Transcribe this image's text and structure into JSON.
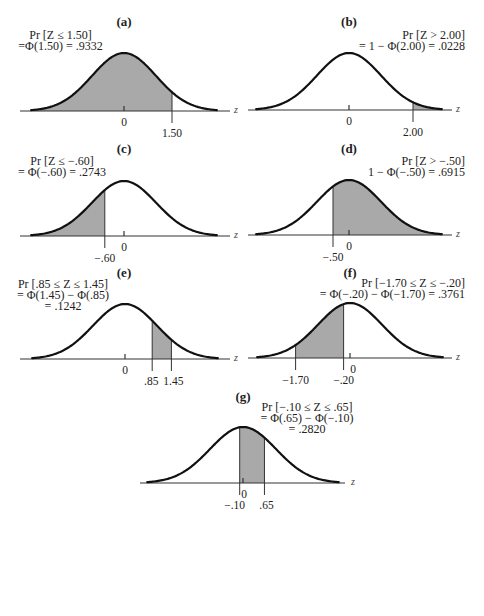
{
  "chart_data": [
    {
      "id": "a",
      "type": "area",
      "panel_label": "(a)",
      "title_lines": [
        "Pr [Z ≤ 1.50]",
        "=Φ(1.50) = .9332"
      ],
      "distribution": "standard normal",
      "shade": {
        "from": null,
        "to": 1.5
      },
      "probability": 0.9332,
      "xlabel": "z",
      "tick_labels": [
        {
          "value": 0,
          "text": "0"
        },
        {
          "value": 1.5,
          "text": "1.50"
        }
      ],
      "xlim": [
        -2.9,
        2.9
      ]
    },
    {
      "id": "b",
      "type": "area",
      "panel_label": "(b)",
      "title_lines": [
        "Pr [Z > 2.00]",
        "= 1 − Φ(2.00) = .0228"
      ],
      "distribution": "standard normal",
      "shade": {
        "from": 2.0,
        "to": null
      },
      "probability": 0.0228,
      "xlabel": "z",
      "tick_labels": [
        {
          "value": 0,
          "text": "0"
        },
        {
          "value": 2.0,
          "text": "2.00"
        }
      ],
      "xlim": [
        -2.9,
        2.9
      ]
    },
    {
      "id": "c",
      "type": "area",
      "panel_label": "(c)",
      "title_lines": [
        "Pr [Z ≤ −.60]",
        "= Φ(−.60) = .2743"
      ],
      "distribution": "standard normal",
      "shade": {
        "from": null,
        "to": -0.6
      },
      "probability": 0.2743,
      "xlabel": "z",
      "tick_labels": [
        {
          "value": 0,
          "text": "0"
        },
        {
          "value": -0.6,
          "text": "−.60"
        }
      ],
      "xlim": [
        -2.9,
        2.9
      ]
    },
    {
      "id": "d",
      "type": "area",
      "panel_label": "(d)",
      "title_lines": [
        "Pr [Z > −.50]",
        "1 − Φ(−.50) = .6915"
      ],
      "distribution": "standard normal",
      "shade": {
        "from": -0.5,
        "to": null
      },
      "probability": 0.6915,
      "xlabel": "z",
      "tick_labels": [
        {
          "value": 0,
          "text": "0"
        },
        {
          "value": -0.5,
          "text": "−.50"
        }
      ],
      "xlim": [
        -2.9,
        2.9
      ]
    },
    {
      "id": "e",
      "type": "area",
      "panel_label": "(e)",
      "title_lines": [
        "Pr [.85 ≤ Z ≤ 1.45]",
        "= Φ(1.45) − Φ(.85)",
        "= .1242"
      ],
      "distribution": "standard normal",
      "shade": {
        "from": 0.85,
        "to": 1.45
      },
      "probability": 0.1242,
      "xlabel": "z",
      "tick_labels": [
        {
          "value": 0,
          "text": "0"
        },
        {
          "value": 0.85,
          "text": ".85"
        },
        {
          "value": 1.45,
          "text": "1.45"
        }
      ],
      "xlim": [
        -2.9,
        2.9
      ]
    },
    {
      "id": "f",
      "type": "area",
      "panel_label": "(f)",
      "title_lines": [
        "Pr [−1.70 ≤ Z ≤ −.20]",
        "= Φ(−.20) − Φ(−1.70) = .3761"
      ],
      "distribution": "standard normal",
      "shade": {
        "from": -1.7,
        "to": -0.2
      },
      "probability": 0.3761,
      "xlabel": "z",
      "tick_labels": [
        {
          "value": 0,
          "text": "0"
        },
        {
          "value": -1.7,
          "text": "−1.70"
        },
        {
          "value": -0.2,
          "text": "−.20"
        }
      ],
      "xlim": [
        -2.9,
        2.9
      ]
    },
    {
      "id": "g",
      "type": "area",
      "panel_label": "(g)",
      "title_lines": [
        "Pr [−.10 ≤ Z ≤ .65]",
        "= Φ(.65) − Φ(−.10)",
        "= .2820"
      ],
      "distribution": "standard normal",
      "shade": {
        "from": -0.1,
        "to": 0.65
      },
      "probability": 0.282,
      "xlabel": "z",
      "tick_labels": [
        {
          "value": 0,
          "text": "0"
        },
        {
          "value": -0.1,
          "text": "−.10"
        },
        {
          "value": 0.65,
          "text": ".65"
        }
      ],
      "xlim": [
        -2.9,
        2.9
      ]
    }
  ],
  "colors": {
    "curve": "#111111",
    "shade": "#a9a9a9",
    "axis": "#333333"
  }
}
